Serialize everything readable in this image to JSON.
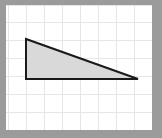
{
  "figure": {
    "canvas": {
      "width": 162,
      "height": 138,
      "background_color": "#ffffff",
      "border_color": "#9b9b9b",
      "border_width_px": 6
    },
    "grid": {
      "visible": true,
      "line_color": "#e6e6e6",
      "cell_size_px": 18,
      "origin_x_px": 2,
      "origin_y_px": 0,
      "columns": 8,
      "rows": 7,
      "vertical_line_x": [
        2,
        20,
        38,
        56,
        74,
        92,
        110,
        128,
        146
      ],
      "horizontal_line_y": [
        0,
        17,
        35,
        53,
        71,
        89,
        107,
        125
      ]
    }
  },
  "chart_data": {
    "type": "scatter",
    "title": "",
    "xlabel": "",
    "ylabel": "",
    "grid": true,
    "legend_position": "none",
    "xlim": [
      0,
      146
    ],
    "ylim": [
      0,
      125
    ],
    "shapes": [
      {
        "name": "right-triangle",
        "kind": "polygon",
        "fill_color": "#d9d9d9",
        "stroke_color": "#1a1a1a",
        "stroke_width_px": 2,
        "vertices": [
          {
            "label": "apex-top-left",
            "x": 20,
            "y": 34
          },
          {
            "label": "right-angle-bottom-left",
            "x": 20,
            "y": 74
          },
          {
            "label": "bottom-right",
            "x": 132,
            "y": 74
          }
        ],
        "vertical_leg_px": 40,
        "horizontal_leg_px": 112,
        "vertical_leg_cells": 2.2,
        "horizontal_leg_cells": 6.2
      }
    ]
  }
}
